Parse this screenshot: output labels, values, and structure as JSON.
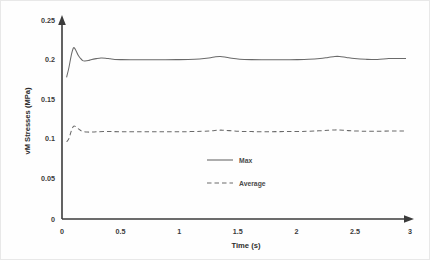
{
  "chart_data": {
    "type": "line",
    "title": "",
    "xlabel": "Time (s)",
    "ylabel": "vM Stresses (MPa)",
    "xlim": [
      0,
      3
    ],
    "ylim": [
      0,
      0.25
    ],
    "xticks": [
      "0",
      "0.5",
      "1",
      "1.5",
      "2",
      "2.5",
      "3"
    ],
    "xtick_values": [
      0,
      0.5,
      1,
      1.5,
      2,
      2.5,
      3
    ],
    "yticks": [
      "0",
      "0.05",
      "0.1",
      "0.15",
      "0.2",
      "0.25"
    ],
    "ytick_values": [
      0,
      0.05,
      0.1,
      0.15,
      0.2,
      0.25
    ],
    "grid": false,
    "legend_position": "center",
    "legend": [
      "Max",
      "Average"
    ],
    "series": [
      {
        "name": "Max",
        "style": "solid",
        "color": "#6a6a6a",
        "x": [
          0.04,
          0.06,
          0.08,
          0.1,
          0.12,
          0.14,
          0.16,
          0.18,
          0.2,
          0.23,
          0.26,
          0.3,
          0.34,
          0.38,
          0.42,
          0.46,
          0.52,
          0.6,
          0.7,
          0.8,
          0.9,
          1.0,
          1.1,
          1.2,
          1.28,
          1.34,
          1.38,
          1.42,
          1.48,
          1.55,
          1.65,
          1.75,
          1.85,
          1.95,
          2.05,
          2.15,
          2.25,
          2.32,
          2.38,
          2.42,
          2.48,
          2.55,
          2.65,
          2.75,
          2.85,
          2.95,
          3.0
        ],
        "y": [
          0.178,
          0.19,
          0.205,
          0.215,
          0.212,
          0.206,
          0.202,
          0.199,
          0.1985,
          0.199,
          0.2005,
          0.2015,
          0.2022,
          0.202,
          0.2012,
          0.2005,
          0.2002,
          0.2,
          0.2,
          0.2,
          0.2001,
          0.2002,
          0.2004,
          0.201,
          0.2022,
          0.2038,
          0.2042,
          0.2036,
          0.202,
          0.2008,
          0.2002,
          0.2,
          0.2,
          0.2001,
          0.2002,
          0.2006,
          0.2016,
          0.203,
          0.2042,
          0.2042,
          0.203,
          0.2016,
          0.2006,
          0.2003,
          0.2016,
          0.2016,
          0.2016
        ]
      },
      {
        "name": "Average",
        "style": "dashed",
        "color": "#6a6a6a",
        "x": [
          0.04,
          0.06,
          0.08,
          0.1,
          0.12,
          0.14,
          0.16,
          0.18,
          0.22,
          0.26,
          0.3,
          0.36,
          0.44,
          0.55,
          0.7,
          0.85,
          1.0,
          1.12,
          1.22,
          1.3,
          1.36,
          1.4,
          1.46,
          1.54,
          1.65,
          1.78,
          1.9,
          2.02,
          2.14,
          2.24,
          2.32,
          2.38,
          2.42,
          2.5,
          2.6,
          2.72,
          2.85,
          2.95,
          3.0
        ],
        "y": [
          0.097,
          0.101,
          0.11,
          0.1165,
          0.116,
          0.1135,
          0.1115,
          0.11,
          0.1092,
          0.1092,
          0.1095,
          0.1098,
          0.1098,
          0.1096,
          0.1095,
          0.1095,
          0.1096,
          0.1098,
          0.1102,
          0.1108,
          0.1115,
          0.1116,
          0.111,
          0.1102,
          0.1098,
          0.1097,
          0.1098,
          0.1099,
          0.1102,
          0.1108,
          0.1114,
          0.1119,
          0.1118,
          0.111,
          0.1104,
          0.1102,
          0.1105,
          0.1105,
          0.1105
        ]
      }
    ]
  },
  "axes": {
    "x_axis_name": "time-axis",
    "y_axis_name": "stress-axis"
  }
}
